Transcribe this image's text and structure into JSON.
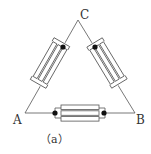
{
  "diagram": {
    "type": "delta-connected-resistors",
    "nodes": [
      {
        "id": "A",
        "label": "A"
      },
      {
        "id": "B",
        "label": "B"
      },
      {
        "id": "C",
        "label": "C"
      }
    ],
    "branches": [
      {
        "from": "A",
        "to": "C",
        "element": "resistor-bank",
        "parallel_elements": 3
      },
      {
        "from": "C",
        "to": "B",
        "element": "resistor-bank",
        "parallel_elements": 3
      },
      {
        "from": "A",
        "to": "B",
        "element": "resistor-bank",
        "parallel_elements": 3
      }
    ],
    "caption": "（a）",
    "colors": {
      "line": "#555555",
      "dot": "#111111",
      "background": "#ffffff"
    }
  }
}
